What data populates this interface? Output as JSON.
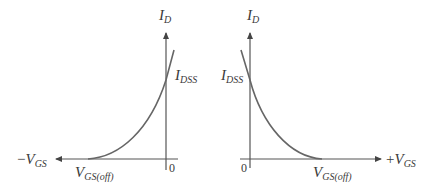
{
  "colors": {
    "axis": "#555555",
    "curve": "#666666",
    "text": "#3a3a3a"
  },
  "left_panel": {
    "y_axis_label": {
      "main": "I",
      "sub": "D"
    },
    "idss_label": {
      "main": "I",
      "sub": "DSS"
    },
    "x_axis_label": {
      "sign": "−",
      "main": "V",
      "sub": "GS"
    },
    "cutoff_label": {
      "main": "V",
      "sub": "GS(off)"
    },
    "origin_label": "0"
  },
  "right_panel": {
    "y_axis_label": {
      "main": "I",
      "sub": "D"
    },
    "idss_label": {
      "main": "I",
      "sub": "DSS"
    },
    "x_axis_label": {
      "sign": "+",
      "main": "V",
      "sub": "GS"
    },
    "cutoff_label": {
      "main": "V",
      "sub": "GS(off)"
    },
    "origin_label": "0"
  }
}
